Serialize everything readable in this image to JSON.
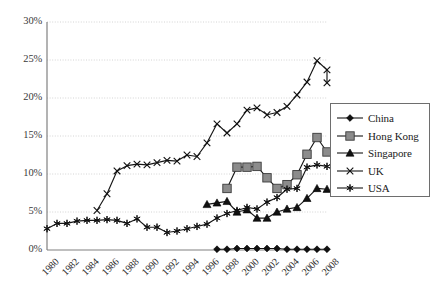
{
  "chart_data": {
    "type": "line",
    "title": "",
    "xlabel": "",
    "ylabel": "",
    "x": [
      1980,
      1981,
      1982,
      1983,
      1984,
      1985,
      1986,
      1987,
      1988,
      1989,
      1990,
      1991,
      1992,
      1993,
      1994,
      1995,
      1996,
      1997,
      1998,
      1999,
      2000,
      2001,
      2002,
      2003,
      2004,
      2005,
      2006,
      2007,
      2008
    ],
    "tick_labels": [
      "1980",
      "1982",
      "1984",
      "1986",
      "1988",
      "1990",
      "1992",
      "1994",
      "1996",
      "1998",
      "2000",
      "2002",
      "2004",
      "2006",
      "2008"
    ],
    "ytick_labels": [
      "0%",
      "5%",
      "10%",
      "15%",
      "20%",
      "25%",
      "30%"
    ],
    "ytick_values": [
      0,
      5,
      10,
      15,
      20,
      25,
      30
    ],
    "ylim": [
      0,
      30
    ],
    "xlim": [
      1980,
      2008
    ],
    "grid": true,
    "legend_position": "right",
    "series": [
      {
        "name": "China",
        "marker": "diamond",
        "color": "#111111",
        "x": [
          1997,
          1998,
          1999,
          2000,
          2001,
          2002,
          2003,
          2004,
          2005,
          2006,
          2007,
          2008
        ],
        "values": [
          0.1,
          0.1,
          0.2,
          0.2,
          0.2,
          0.2,
          0.2,
          0.1,
          0.1,
          0.1,
          0.1,
          0.1
        ]
      },
      {
        "name": "Hong Kong",
        "marker": "square",
        "color": "#8c8c8c",
        "x": [
          1998,
          1999,
          2000,
          2001,
          2002,
          2003,
          2004,
          2005,
          2006,
          2007,
          2008
        ],
        "values": [
          8.1,
          10.9,
          10.9,
          11.0,
          9.5,
          8.1,
          8.6,
          9.9,
          12.6,
          14.8,
          12.9
        ]
      },
      {
        "name": "Singapore",
        "marker": "triangle",
        "color": "#111111",
        "x": [
          1996,
          1997,
          1998,
          1999,
          2000,
          2001,
          2002,
          2003,
          2004,
          2005,
          2006,
          2007,
          2008
        ],
        "values": [
          6.0,
          6.2,
          6.4,
          5.0,
          5.3,
          4.2,
          4.2,
          5.0,
          5.4,
          5.6,
          6.8,
          8.1,
          8.0
        ]
      },
      {
        "name": "UK",
        "marker": "cross",
        "color": "#111111",
        "x": [
          1985,
          1986,
          1987,
          1988,
          1989,
          1990,
          1991,
          1992,
          1993,
          1994,
          1995,
          1996,
          1997,
          1998,
          1999,
          2000,
          2001,
          2002,
          2003,
          2004,
          2005,
          2006,
          2007,
          2008
        ],
        "values": [
          5.2,
          7.4,
          10.4,
          11.1,
          11.3,
          11.2,
          11.5,
          11.8,
          11.7,
          12.5,
          12.3,
          14.1,
          16.6,
          15.4,
          16.6,
          18.4,
          18.7,
          17.8,
          18.1,
          18.9,
          20.4,
          22.1,
          24.9,
          23.7
        ]
      },
      {
        "name": "USA",
        "marker": "star",
        "color": "#111111",
        "x": [
          1980,
          1981,
          1982,
          1983,
          1984,
          1985,
          1986,
          1987,
          1988,
          1989,
          1990,
          1991,
          1992,
          1993,
          1994,
          1995,
          1996,
          1997,
          1998,
          1999,
          2000,
          2001,
          2002,
          2003,
          2004,
          2005,
          2006,
          2007,
          2008
        ],
        "values": [
          2.8,
          3.5,
          3.5,
          3.8,
          3.9,
          3.9,
          4.0,
          3.9,
          3.5,
          4.1,
          3.0,
          3.0,
          2.3,
          2.5,
          2.8,
          3.1,
          3.4,
          4.2,
          4.8,
          5.2,
          5.6,
          5.4,
          6.3,
          6.9,
          8.0,
          8.1,
          10.9,
          11.2,
          11.0
        ]
      }
    ]
  },
  "extra_points": {
    "uk_tail": {
      "x": 2008,
      "value": 22.0
    }
  }
}
